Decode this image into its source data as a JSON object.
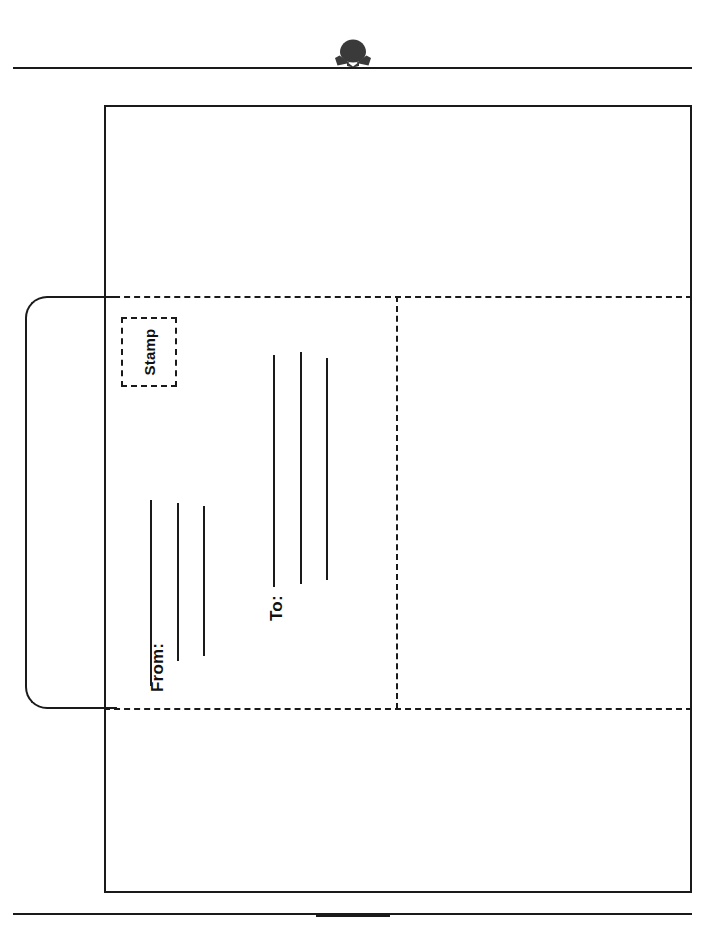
{
  "page": {
    "orientation": "portrait-print-landscape-read",
    "background_color": "#ffffff",
    "ink_color": "#1a1a1a"
  },
  "header": {
    "icon": "mail-envelope-icon",
    "rule": "horizontal-divider"
  },
  "footer": {
    "rule": "horizontal-divider",
    "tab": "center-tab-mark"
  },
  "envelope": {
    "outline_name": "envelope-outline",
    "left_flap_name": "envelope-left-flap",
    "fold_lines": {
      "top": "fold-line-top",
      "bottom": "fold-line-bottom",
      "vertical": "fold-line-vertical"
    }
  },
  "stamp": {
    "label": "Stamp",
    "box_name": "stamp-placement-box"
  },
  "address": {
    "to_label": "To:",
    "from_label": "From:",
    "to_rules": [
      {
        "left": 273,
        "top": 355,
        "height": 232
      },
      {
        "left": 300,
        "top": 352,
        "height": 232
      },
      {
        "left": 326,
        "top": 358,
        "height": 222
      }
    ],
    "from_rules": [
      {
        "left": 150,
        "top": 500,
        "height": 186
      },
      {
        "left": 177,
        "top": 503,
        "height": 158
      },
      {
        "left": 203,
        "top": 506,
        "height": 150
      }
    ]
  }
}
